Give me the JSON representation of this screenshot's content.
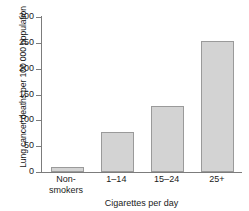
{
  "chart_data": {
    "type": "bar",
    "title": "",
    "xlabel": "Cigarettes per day",
    "ylabel": "Lung cancer deaths per 100 000 population",
    "categories": [
      "Non-smokers",
      "1–14",
      "15–24",
      "25+"
    ],
    "category_lines": [
      [
        "Non-",
        "smokers"
      ],
      [
        "1–14"
      ],
      [
        "15–24"
      ],
      [
        "25+"
      ]
    ],
    "values": [
      10,
      78,
      127,
      253
    ],
    "ylim": [
      0,
      300
    ],
    "yticks": [
      0,
      50,
      100,
      150,
      200,
      250,
      300
    ],
    "ytick_labels": [
      "0",
      "50",
      "100",
      "150",
      "200",
      "250",
      "300"
    ],
    "grid": false,
    "legend": false,
    "colors": {
      "bar_fill": "#d3d3d3",
      "bar_border": "#9a9a9a",
      "axis": "#7c7c7c",
      "text": "#1a1a1a",
      "background": "#ffffff"
    }
  }
}
